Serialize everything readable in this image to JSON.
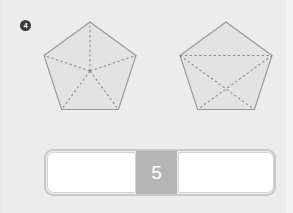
{
  "exercise": {
    "number_badge": "4",
    "badge_icon": "numbered-circle-icon"
  },
  "figures": [
    {
      "name": "pentagon-five-triangles",
      "shape": "pentagon",
      "fill_color": "#e3e3e3",
      "stroke_color": "#9a9a9a",
      "dash_color": "#8e8e8e",
      "sides": 5,
      "division_count": 5,
      "division_style": "center-to-vertices"
    },
    {
      "name": "pentagon-four-triangles",
      "shape": "pentagon",
      "fill_color": "#e3e3e3",
      "stroke_color": "#9a9a9a",
      "dash_color": "#8e8e8e",
      "sides": 5,
      "division_count": 4,
      "division_style": "chord-and-crossing-diagonals"
    }
  ],
  "answer_row": {
    "left_input": {
      "value": "",
      "placeholder": ""
    },
    "count_chip": {
      "value": "5"
    },
    "right_input": {
      "value": "",
      "placeholder": ""
    }
  },
  "colors": {
    "background": "#ececec",
    "shape_fill": "#e3e3e3",
    "shape_stroke": "#9a9a9a",
    "chip_background": "#b5b5b5",
    "chip_text": "#ffffff",
    "input_background": "#ffffff",
    "badge_background": "#3a3a3a"
  }
}
